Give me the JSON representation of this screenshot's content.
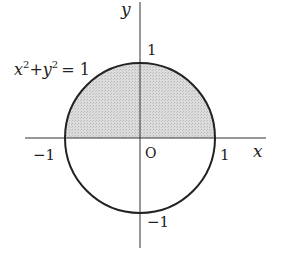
{
  "diagram": {
    "type": "unit-circle",
    "equation": {
      "base_x": "x",
      "sup_x": "2",
      "plus": "+",
      "base_y": "y",
      "sup_y": "2",
      "rhs": "= 1"
    },
    "axes": {
      "x_label": "x",
      "y_label": "y",
      "origin_label": "O"
    },
    "ticks": {
      "x_pos": "1",
      "x_neg": "−1",
      "y_pos": "1",
      "y_neg": "−1"
    },
    "shaded_region": "upper half-disk (y ≥ 0)",
    "colors": {
      "stroke": "#222222",
      "fill": "#d4d4d4"
    }
  }
}
